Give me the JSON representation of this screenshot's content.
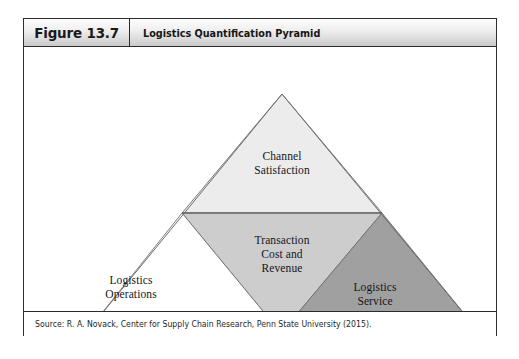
{
  "figure": {
    "number_label": "Figure 13.7",
    "title": "Logistics Quantification Pyramid",
    "source": "Source: R. A. Novack, Center for Supply Chain Research, Penn State University (2015)."
  },
  "colors": {
    "frame_border": "#2b2b2b",
    "header_gradient_top": "#fdfdfd",
    "header_gradient_bottom": "#c9c9c9",
    "tier_top_fill": "#ececec",
    "tier_middle_fill": "#cdcdcd",
    "tier_right_fill": "#a0a0a0",
    "tier_left_fill": "#ffffff",
    "outline": "#6e6e6e",
    "text": "#14161c"
  },
  "diagram": {
    "type": "pyramid",
    "apex": {
      "x": 258,
      "y": 47
    },
    "base_left": {
      "x": 62,
      "y": 286
    },
    "base_right": {
      "x": 456,
      "y": 286
    },
    "divider_y": 166,
    "divider_left_x": 158,
    "divider_right_x": 358,
    "inner_bottom": {
      "x": 257,
      "y": 286
    },
    "regions": [
      {
        "id": "channel-satisfaction",
        "label_lines": [
          "Channel",
          "Satisfaction"
        ],
        "fill": "#ececec",
        "shape": "top-triangle"
      },
      {
        "id": "transaction-cost-and-revenue",
        "label_lines": [
          "Transaction",
          "Cost and",
          "Revenue"
        ],
        "fill": "#cdcdcd",
        "shape": "inverted-triangle"
      },
      {
        "id": "logistics-operations",
        "label_lines": [
          "Logistics",
          "Operations"
        ],
        "fill": "#ffffff",
        "shape": "left-triangle"
      },
      {
        "id": "logistics-service",
        "label_lines": [
          "Logistics",
          "Service"
        ],
        "fill": "#a0a0a0",
        "shape": "right-triangle"
      }
    ]
  },
  "labels": {
    "channel_line1": "Channel",
    "channel_line2": "Satisfaction",
    "transaction_line1": "Transaction",
    "transaction_line2": "Cost and",
    "transaction_line3": "Revenue",
    "logistics_operations_line1": "Logistics",
    "logistics_operations_line2": "Operations",
    "logistics_service_line1": "Logistics",
    "logistics_service_line2": "Service"
  }
}
